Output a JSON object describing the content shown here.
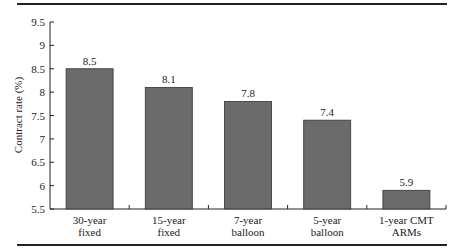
{
  "chart_data": {
    "type": "bar",
    "title": "",
    "xlabel": "",
    "ylabel": "Contract rate (%)",
    "categories": [
      "30-year fixed",
      "15-year fixed",
      "7-year balloon",
      "5-year balloon",
      "1-year CMT ARMs"
    ],
    "category_lines": [
      [
        "30-year",
        "fixed"
      ],
      [
        "15-year",
        "fixed"
      ],
      [
        "7-year",
        "balloon"
      ],
      [
        "5-year",
        "balloon"
      ],
      [
        "1-year CMT",
        "ARMs"
      ]
    ],
    "values": [
      8.5,
      8.1,
      7.8,
      7.4,
      5.9
    ],
    "value_labels": [
      "8.5",
      "8.1",
      "7.8",
      "7.4",
      "5.9"
    ],
    "ylim": [
      5.5,
      9.5
    ],
    "yticks": [
      5.5,
      6,
      6.5,
      7,
      7.5,
      8,
      8.5,
      9,
      9.5
    ],
    "ytick_labels": [
      "5.5",
      "6",
      "6.5",
      "7",
      "7.5",
      "8",
      "8.5",
      "9",
      "9.5"
    ],
    "grid": false,
    "legend": null,
    "bar_color": "#6b6b6b"
  }
}
